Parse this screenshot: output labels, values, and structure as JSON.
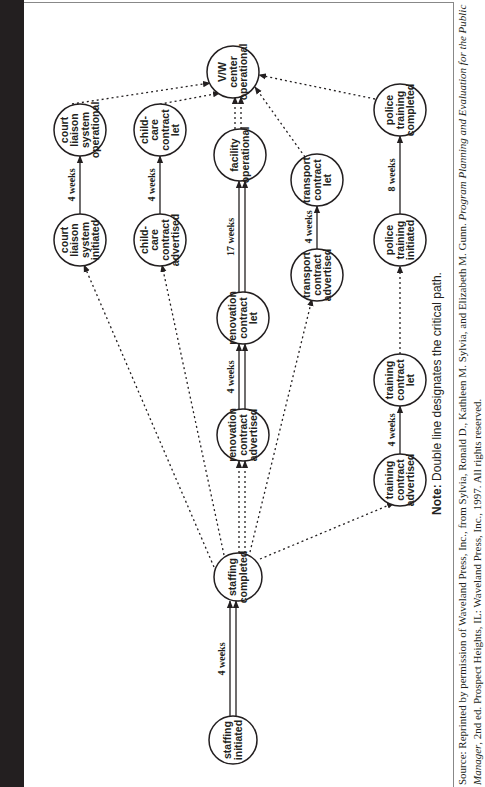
{
  "figure": {
    "title": "Figure 16.2 • PERT Chart for Opening a Victim/Witness Service Center",
    "note_label": "Note:",
    "note_text": " Double line designates the critical path.",
    "source_prefix": "Source: Reprinted by permission of Waveland Press, Inc., from Sylvia, Ronald D., Kathleen M. Sylvia, and Elizabeth M. Gunn. ",
    "source_book_title": "Program Planning and Evaluation for the Public Manager",
    "source_suffix": ", 2nd ed. Prospect Heights, IL: Waveland Press, Inc., 1997. All rights reserved.",
    "orientation": "rotated 90° (landscape page printed sideways)"
  },
  "chart_data": {
    "type": "pert-network",
    "title": "PERT Chart for Opening a Victim/Witness Service Center",
    "legend": "Double line designates the critical path.",
    "nodes": [
      {
        "id": "staffing_initiated",
        "label": [
          "staffing",
          "initiated"
        ]
      },
      {
        "id": "staffing_completed",
        "label": [
          "staffing",
          "completed"
        ]
      },
      {
        "id": "renovation_advertised",
        "label": [
          "renovation",
          "contract",
          "advertised"
        ]
      },
      {
        "id": "renovation_let",
        "label": [
          "renovation",
          "contract",
          "let"
        ]
      },
      {
        "id": "facility_operational",
        "label": [
          "facility",
          "operational"
        ]
      },
      {
        "id": "vw_center_operational",
        "label": [
          "V/W",
          "center",
          "operational"
        ]
      },
      {
        "id": "court_initiated",
        "label": [
          "court",
          "liaison",
          "system",
          "initiated"
        ]
      },
      {
        "id": "court_operational",
        "label": [
          "court",
          "liaison",
          "system",
          "operational"
        ]
      },
      {
        "id": "childcare_advertised",
        "label": [
          "child-",
          "care",
          "contract",
          "advertised"
        ]
      },
      {
        "id": "childcare_let",
        "label": [
          "child-",
          "care",
          "contract",
          "let"
        ]
      },
      {
        "id": "transport_advertised",
        "label": [
          "transport",
          "contract",
          "advertised"
        ]
      },
      {
        "id": "transport_let",
        "label": [
          "transport",
          "contract",
          "let"
        ]
      },
      {
        "id": "training_advertised",
        "label": [
          "training",
          "contract",
          "advertised"
        ]
      },
      {
        "id": "training_let",
        "label": [
          "training",
          "contract",
          "let"
        ]
      },
      {
        "id": "police_initiated",
        "label": [
          "police",
          "training",
          "initiated"
        ]
      },
      {
        "id": "police_completed",
        "label": [
          "police",
          "training",
          "completed"
        ]
      }
    ],
    "edges": [
      {
        "from": "staffing_initiated",
        "to": "staffing_completed",
        "duration": "4 weeks",
        "style": "double"
      },
      {
        "from": "staffing_completed",
        "to": "renovation_advertised",
        "duration": "",
        "style": "double-dotted"
      },
      {
        "from": "renovation_advertised",
        "to": "renovation_let",
        "duration": "4 weeks",
        "style": "double"
      },
      {
        "from": "renovation_let",
        "to": "facility_operational",
        "duration": "17 weeks",
        "style": "double"
      },
      {
        "from": "facility_operational",
        "to": "vw_center_operational",
        "duration": "",
        "style": "double-dotted"
      },
      {
        "from": "staffing_completed",
        "to": "court_initiated",
        "duration": "",
        "style": "dotted"
      },
      {
        "from": "court_initiated",
        "to": "court_operational",
        "duration": "4 weeks",
        "style": "solid"
      },
      {
        "from": "court_operational",
        "to": "vw_center_operational",
        "duration": "",
        "style": "dotted"
      },
      {
        "from": "staffing_completed",
        "to": "childcare_advertised",
        "duration": "",
        "style": "dotted"
      },
      {
        "from": "childcare_advertised",
        "to": "childcare_let",
        "duration": "4 weeks",
        "style": "solid"
      },
      {
        "from": "childcare_let",
        "to": "vw_center_operational",
        "duration": "",
        "style": "dotted"
      },
      {
        "from": "staffing_completed",
        "to": "transport_advertised",
        "duration": "",
        "style": "dotted"
      },
      {
        "from": "transport_advertised",
        "to": "transport_let",
        "duration": "4 weeks",
        "style": "solid"
      },
      {
        "from": "transport_let",
        "to": "vw_center_operational",
        "duration": "",
        "style": "dotted"
      },
      {
        "from": "staffing_completed",
        "to": "training_advertised",
        "duration": "",
        "style": "dotted"
      },
      {
        "from": "training_advertised",
        "to": "training_let",
        "duration": "4 weeks",
        "style": "solid"
      },
      {
        "from": "training_let",
        "to": "police_initiated",
        "duration": "",
        "style": "dotted"
      },
      {
        "from": "police_initiated",
        "to": "police_completed",
        "duration": "8 weeks",
        "style": "solid"
      },
      {
        "from": "police_completed",
        "to": "vw_center_operational",
        "duration": "",
        "style": "dotted"
      }
    ],
    "critical_path": [
      "staffing_initiated",
      "staffing_completed",
      "renovation_advertised",
      "renovation_let",
      "facility_operational",
      "vw_center_operational"
    ],
    "critical_path_total": "25 weeks"
  },
  "labels": {
    "n_staffing_initiated": [
      "staffing",
      "initiated"
    ],
    "n_staffing_completed": [
      "staffing",
      "completed"
    ],
    "n_renovation_advertised": [
      "renovation",
      "contract",
      "advertised"
    ],
    "n_renovation_let": [
      "renovation",
      "contract",
      "let"
    ],
    "n_facility_operational": [
      "facility",
      "operational"
    ],
    "n_vw_center": [
      "V/W",
      "center",
      "operational"
    ],
    "n_court_initiated": [
      "court",
      "liaison",
      "system",
      "initiated"
    ],
    "n_court_operational": [
      "court",
      "liaison",
      "system",
      "operational"
    ],
    "n_childcare_advertised": [
      "child-",
      "care",
      "contract",
      "advertised"
    ],
    "n_childcare_let": [
      "child-",
      "care",
      "contract",
      "let"
    ],
    "n_transport_advertised": [
      "transport",
      "contract",
      "advertised"
    ],
    "n_transport_let": [
      "transport",
      "contract",
      "let"
    ],
    "n_training_advertised": [
      "training",
      "contract",
      "advertised"
    ],
    "n_training_let": [
      "training",
      "contract",
      "let"
    ],
    "n_police_initiated": [
      "police",
      "training",
      "initiated"
    ],
    "n_police_completed": [
      "police",
      "training",
      "completed"
    ],
    "d_staffing": "4 weeks",
    "d_renovation": "4 weeks",
    "d_facility": "17 weeks",
    "d_court": "4 weeks",
    "d_childcare": "4 weeks",
    "d_transport": "4 weeks",
    "d_training": "4 weeks",
    "d_police": "8 weeks"
  }
}
